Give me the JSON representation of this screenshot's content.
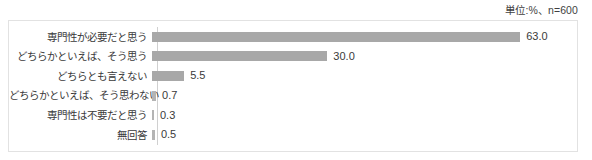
{
  "unit_note": "単位:%、n=600",
  "colors": {
    "bar": "#a8a8a8",
    "frame_border": "#e2e2e2",
    "axis_line": "#d0d0d0",
    "text": "#3a3a3a"
  },
  "chart_data": {
    "type": "bar",
    "orientation": "horizontal",
    "title": "",
    "subtitle": "",
    "xlabel": "",
    "ylabel": "",
    "annotations": [
      "単位:%、n=600"
    ],
    "grid": false,
    "legend": false,
    "xlim": [
      0,
      63
    ],
    "unit": "%",
    "sample_size": 600,
    "categories": [
      "専門性が必要だと思う",
      "どちらかといえば、そう思う",
      "どちらとも言えない",
      "どちらかといえば、そう思わない",
      "専門性は不要だと思う",
      "無回答"
    ],
    "values": [
      63.0,
      30.0,
      5.5,
      0.7,
      0.3,
      0.5
    ],
    "value_labels": [
      "63.0",
      "30.0",
      "5.5",
      "0.7",
      "0.3",
      "0.5"
    ]
  }
}
